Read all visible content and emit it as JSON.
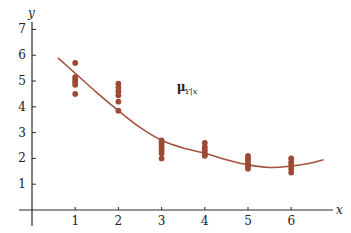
{
  "chart_data": {
    "type": "scatter",
    "title": "",
    "xlabel": "x",
    "ylabel": "y",
    "xlim": [
      0,
      7
    ],
    "ylim": [
      0,
      7
    ],
    "grid": false,
    "legend": null,
    "x_ticks": [
      1,
      2,
      3,
      4,
      5,
      6
    ],
    "y_ticks": [
      1,
      2,
      3,
      4,
      5,
      6,
      7
    ],
    "series": [
      {
        "name": "observations",
        "kind": "scatter",
        "points": [
          [
            1,
            5.7
          ],
          [
            1,
            5.15
          ],
          [
            1,
            5.05
          ],
          [
            1,
            4.95
          ],
          [
            1,
            4.85
          ],
          [
            1,
            4.5
          ],
          [
            2,
            4.9
          ],
          [
            2,
            4.75
          ],
          [
            2,
            4.6
          ],
          [
            2,
            4.45
          ],
          [
            2,
            4.2
          ],
          [
            2,
            3.85
          ],
          [
            3,
            2.7
          ],
          [
            3,
            2.6
          ],
          [
            3,
            2.5
          ],
          [
            3,
            2.4
          ],
          [
            3,
            2.3
          ],
          [
            3,
            2.2
          ],
          [
            3,
            2.0
          ],
          [
            4,
            2.6
          ],
          [
            4,
            2.45
          ],
          [
            4,
            2.35
          ],
          [
            4,
            2.25
          ],
          [
            4,
            2.15
          ],
          [
            4,
            2.1
          ],
          [
            5,
            2.1
          ],
          [
            5,
            2.0
          ],
          [
            5,
            1.9
          ],
          [
            5,
            1.8
          ],
          [
            5,
            1.7
          ],
          [
            5,
            1.6
          ],
          [
            6,
            2.0
          ],
          [
            6,
            1.85
          ],
          [
            6,
            1.75
          ],
          [
            6,
            1.6
          ],
          [
            6,
            1.45
          ]
        ]
      },
      {
        "name": "mean regression curve μY|x",
        "kind": "line",
        "points": [
          [
            0.6,
            5.9
          ],
          [
            1.0,
            5.3
          ],
          [
            1.5,
            4.55
          ],
          [
            2.0,
            3.85
          ],
          [
            2.5,
            3.2
          ],
          [
            3.0,
            2.7
          ],
          [
            3.5,
            2.4
          ],
          [
            4.0,
            2.2
          ],
          [
            4.5,
            1.95
          ],
          [
            5.0,
            1.75
          ],
          [
            5.5,
            1.65
          ],
          [
            6.0,
            1.7
          ],
          [
            6.4,
            1.8
          ],
          [
            6.75,
            1.95
          ]
        ]
      }
    ],
    "annotations": [
      {
        "text": "μ",
        "subscript": "Y|x",
        "x": 3.35,
        "y": 4.6
      }
    ],
    "colors": {
      "points": "#9b4a36",
      "curve": "#a4523d",
      "axis": "#2b2b2b"
    }
  }
}
